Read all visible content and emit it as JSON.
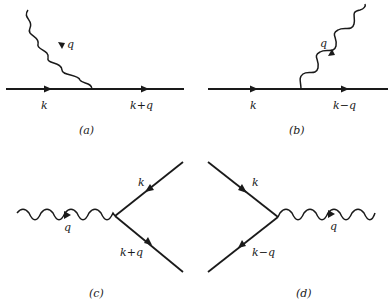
{
  "figure": {
    "panels": [
      {
        "id": "a",
        "caption": "(a)",
        "fermion_in": "k",
        "fermion_out": "k+q",
        "photon": "q",
        "description": "electron absorbs incoming photon"
      },
      {
        "id": "b",
        "caption": "(b)",
        "fermion_in": "k",
        "fermion_out": "k−q",
        "photon": "q",
        "description": "electron emits outgoing photon"
      },
      {
        "id": "c",
        "caption": "(c)",
        "fermion_in": "k",
        "fermion_out": "k+q",
        "photon": "q",
        "description": "photon absorbed at vertex with fermion pair"
      },
      {
        "id": "d",
        "caption": "(d)",
        "fermion_in": "k",
        "fermion_out": "k−q",
        "photon": "q",
        "description": "photon emitted at vertex with fermion pair"
      }
    ],
    "colors": {
      "line": "#1a1a1a",
      "background": "#ffffff"
    }
  }
}
